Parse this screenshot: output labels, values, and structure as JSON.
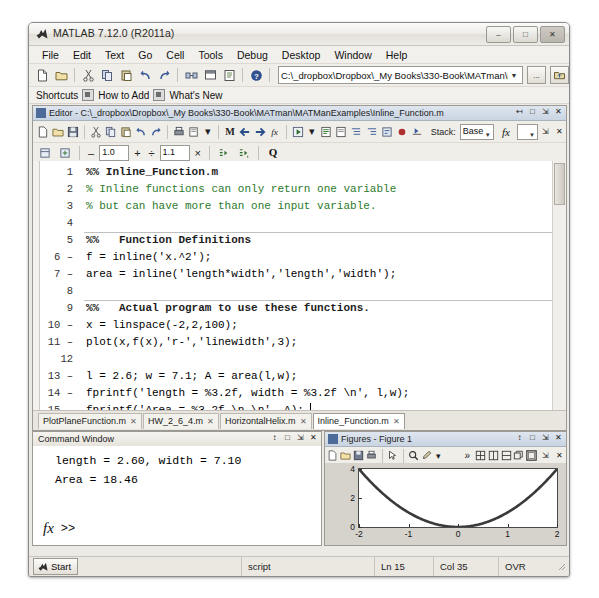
{
  "window": {
    "title": "MATLAB 7.12.0 (R2011a)",
    "app_icon": "matlab-logo-icon",
    "minimize": "–",
    "maximize": "□",
    "close": "✕"
  },
  "menubar": {
    "items": [
      {
        "label": "File",
        "mnemonic": "F"
      },
      {
        "label": "Edit",
        "mnemonic": "E"
      },
      {
        "label": "Text",
        "mnemonic": "T"
      },
      {
        "label": "Go",
        "mnemonic": "G"
      },
      {
        "label": "Cell",
        "mnemonic": "C"
      },
      {
        "label": "Tools",
        "mnemonic": "o"
      },
      {
        "label": "Debug",
        "mnemonic": "b"
      },
      {
        "label": "Desktop",
        "mnemonic": "D"
      },
      {
        "label": "Window",
        "mnemonic": "W"
      },
      {
        "label": "Help",
        "mnemonic": "H"
      }
    ]
  },
  "toolbar": {
    "buttons": [
      "new-file-icon",
      "open-file-icon",
      "cut-icon",
      "copy-icon",
      "paste-icon",
      "undo-icon",
      "redo-icon",
      "simulink-icon",
      "guide-icon",
      "profiler-icon",
      "help-icon"
    ],
    "path_value": "C:\\_dropbox\\Dropbox\\_My Books\\330-Book\\MATman\\MATManExamples",
    "path_dropdown": "chevron-down-icon",
    "browse_label": "...",
    "up_folder_label": "up-folder-icon"
  },
  "shortcuts_bar": {
    "label": "Shortcuts",
    "items": [
      "How to Add",
      "What's New"
    ]
  },
  "editor": {
    "title": "Editor - C:\\_dropbox\\Dropbox\\_My Books\\330-Book\\MATman\\MATManExamples\\Inline_Function.m",
    "window_controls": [
      "undock-icon",
      "maximize-icon",
      "minimize-icon",
      "close-icon"
    ],
    "toolbar_buttons": [
      "new-file-icon",
      "open-file-icon",
      "save-icon",
      "cut-icon",
      "copy-icon",
      "paste-icon",
      "undo-icon",
      "redo-icon",
      "print-icon",
      "print-preview-icon",
      "find-icon",
      "back-icon",
      "forward-icon",
      "function-browser-icon",
      "run-icon",
      "comment-icon",
      "uncomment-icon",
      "indent-decrease-icon",
      "indent-increase-icon",
      "smart-indent-icon",
      "breakpoint-icon",
      "step-icon",
      "stack-label"
    ],
    "stack_label": "Stack:",
    "stack_value": "Base",
    "fx_label": "fx",
    "cell_toolbar": {
      "enable_cell_mode_icon": "cell-mode-icon",
      "insert_cell_icon": "insert-cell-icon",
      "minus_label": "–",
      "divide_value": "1.0",
      "plus_label": "+",
      "div_label": "÷",
      "multiply_value": "1.1",
      "times_label": "×",
      "eval_cell_icon": "evaluate-cell-icon",
      "eval_cell_advance_icon": "evaluate-cell-advance-icon",
      "quick_find_icon": "quick-find-icon"
    },
    "code": [
      {
        "n": "1",
        "mark": "",
        "text": "%% Inline_Function.m",
        "style": "cellhdr",
        "rule": false
      },
      {
        "n": "2",
        "mark": "",
        "text": "% Inline functions can only return one variable",
        "style": "cmt",
        "rule": false
      },
      {
        "n": "3",
        "mark": "",
        "text": "% but can have more than one input variable.",
        "style": "cmt",
        "rule": false
      },
      {
        "n": "4",
        "mark": "",
        "text": "",
        "style": "",
        "rule": false
      },
      {
        "n": "5",
        "mark": "",
        "text": "%%   Function Definitions",
        "style": "cellhdr",
        "rule": true
      },
      {
        "n": "6",
        "mark": "–",
        "text": "f = inline('x.^2');",
        "style": "",
        "rule": false
      },
      {
        "n": "7",
        "mark": "–",
        "text": "area = inline('length*width','length','width');",
        "style": "",
        "rule": false
      },
      {
        "n": "8",
        "mark": "",
        "text": "",
        "style": "",
        "rule": false
      },
      {
        "n": "9",
        "mark": "",
        "text": "%%   Actual program to use these functions.",
        "style": "cellhdr",
        "rule": true
      },
      {
        "n": "10",
        "mark": "–",
        "text": "x = linspace(-2,2,100);",
        "style": "",
        "rule": false
      },
      {
        "n": "11",
        "mark": "–",
        "text": "plot(x,f(x),'r-','linewidth',3);",
        "style": "",
        "rule": false
      },
      {
        "n": "12",
        "mark": "",
        "text": "",
        "style": "",
        "rule": false
      },
      {
        "n": "13",
        "mark": "–",
        "text": "l = 2.6; w = 7.1; A = area(l,w);",
        "style": "",
        "rule": false
      },
      {
        "n": "14",
        "mark": "–",
        "text": "fprintf('length = %3.2f, width = %3.2f \\n', l,w);",
        "style": "",
        "rule": false
      },
      {
        "n": "15",
        "mark": "–",
        "text": "fprintf('Area = %3.2f \\n \\n', A);",
        "style": "",
        "rule": false
      }
    ],
    "file_tabs": [
      {
        "label": "PlotPlaneFunction.m",
        "active": false,
        "close": "✕"
      },
      {
        "label": "HW_2_6_4.m",
        "active": false,
        "close": "✕"
      },
      {
        "label": "HorizontalHelix.m",
        "active": false,
        "close": "✕"
      },
      {
        "label": "Inline_Function.m",
        "active": true,
        "close": "✕"
      }
    ]
  },
  "command_window": {
    "title": "Command Window",
    "window_controls": [
      "undock-icon",
      "maximize-icon",
      "minimize-icon",
      "close-icon"
    ],
    "output": [
      "length = 2.60, width = 7.10",
      "Area = 18.46"
    ],
    "prompt_fx": "fx",
    "prompt": ">>"
  },
  "figure_window": {
    "title": "Figures - Figure 1",
    "window_controls": [
      "undock-icon",
      "maximize-icon",
      "minimize-icon",
      "close-icon"
    ],
    "toolbar_buttons": [
      "new-figure-icon",
      "open-figure-icon",
      "save-figure-icon",
      "print-figure-icon",
      "pointer-icon",
      "zoom-icon",
      "brush-icon",
      "brush-dropdown-icon",
      "overflow-icon",
      "tile-grid-icon",
      "tile-vertical-icon",
      "tile-horizontal-icon",
      "float-icon",
      "dock-icon"
    ],
    "more_label": "»"
  },
  "chart_data": {
    "type": "line",
    "title": "Figure 1",
    "xlabel": "",
    "ylabel": "",
    "xlim": [
      -2,
      2
    ],
    "ylim": [
      0,
      4
    ],
    "xticks": [
      -2,
      -1,
      0,
      1,
      2
    ],
    "xticklabels": [
      "-2",
      "-1",
      "0",
      "1",
      "2"
    ],
    "yticks": [
      0,
      2,
      4
    ],
    "yticklabels": [
      "0",
      "2",
      "4"
    ],
    "grid": false,
    "legend": null,
    "series": [
      {
        "name": "f(x) = x.^2",
        "color": "#3a3a3a",
        "linewidth": 3,
        "linestyle": "-",
        "x": [
          -2,
          -1.8,
          -1.6,
          -1.4,
          -1.2,
          -1,
          -0.8,
          -0.6,
          -0.4,
          -0.2,
          0,
          0.2,
          0.4,
          0.6,
          0.8,
          1,
          1.2,
          1.4,
          1.6,
          1.8,
          2
        ],
        "y": [
          4,
          3.24,
          2.56,
          1.96,
          1.44,
          1,
          0.64,
          0.36,
          0.16,
          0.04,
          0,
          0.04,
          0.16,
          0.36,
          0.64,
          1,
          1.44,
          1.96,
          2.56,
          3.24,
          4
        ]
      }
    ]
  },
  "statusbar": {
    "start_label": "Start",
    "start_icon": "matlab-logo-icon",
    "file_type": "script",
    "line_label": "Ln",
    "line_value": "15",
    "col_label": "Col",
    "col_value": "35",
    "insert_mode": "OVR"
  },
  "colors": {
    "window_chrome": "#eceae4",
    "editor_title": "#c9d4e2",
    "comment_green": "#2b7a2b",
    "plot_line": "#3a3a3a",
    "plot_bg": "#ffffff",
    "figure_bg": "#d6d3cd"
  }
}
